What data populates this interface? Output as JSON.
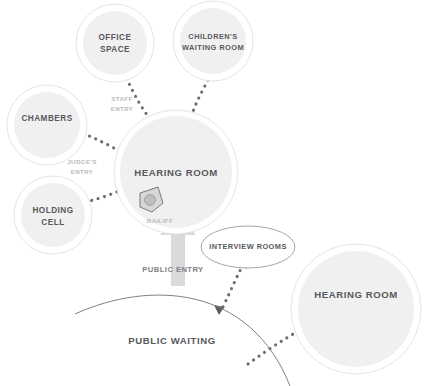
{
  "diagram": {
    "colors": {
      "circle_fill": "#f0f0f1",
      "circle_ring": "#e3e4e5",
      "label_dark": "#58595b",
      "label_light": "#b9bbbd",
      "label_mid": "#808184",
      "dotted_path": "#6d6e71",
      "public_arrow": "#d9dadb",
      "background": "#ffffff"
    },
    "nodes": [
      {
        "id": "office-space",
        "label_line1": "OFFICE",
        "label_line2": "SPACE",
        "shape": "circle"
      },
      {
        "id": "childrens-waiting-room",
        "label_line1": "CHILDREN'S",
        "label_line2": "WAITING ROOM",
        "shape": "circle"
      },
      {
        "id": "chambers",
        "label_line1": "CHAMBERS",
        "label_line2": "",
        "shape": "circle"
      },
      {
        "id": "holding-cell",
        "label_line1": "HOLDING",
        "label_line2": "CELL",
        "shape": "circle"
      },
      {
        "id": "hearing-room-main",
        "label_line1": "HEARING ROOM",
        "label_line2": "",
        "shape": "circle"
      },
      {
        "id": "interview-rooms",
        "label_line1": "INTERVIEW ROOMS",
        "label_line2": "",
        "shape": "ellipse"
      },
      {
        "id": "hearing-room-secondary",
        "label_line1": "HEARING ROOM",
        "label_line2": "",
        "shape": "circle"
      }
    ],
    "flow_labels": [
      {
        "id": "staff-entry",
        "line1": "STAFF",
        "line2": "ENTRY"
      },
      {
        "id": "judges-entry",
        "line1": "JUDGE'S",
        "line2": "ENTRY"
      },
      {
        "id": "bailiff",
        "line1": "BAILIFF",
        "line2": ""
      },
      {
        "id": "public-entry",
        "line1": "PUBLIC ENTRY",
        "line2": ""
      }
    ],
    "area_labels": [
      {
        "id": "public-waiting",
        "text": "PUBLIC WAITING"
      }
    ]
  }
}
